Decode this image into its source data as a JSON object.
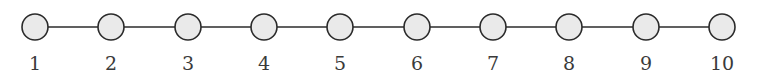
{
  "figure": {
    "background_color": "#ffffff",
    "layout": "horizontal-path"
  },
  "style": {
    "node_fill": "#eaeaea",
    "node_stroke": "#2b2b2b",
    "node_stroke_width": 1.6,
    "node_radius": 13,
    "edge_stroke": "#2b2b2b",
    "edge_stroke_width": 1.5,
    "label_color": "#3a3a3a",
    "label_font_size": 19,
    "label_baseline_y": 70,
    "node_center_y": 27
  },
  "chart_data": {
    "type": "diagram",
    "diagram_kind": "graph",
    "graph_family": "path",
    "title": "",
    "xlabel": "",
    "ylabel": "",
    "node_count": 10,
    "edge_count": 9,
    "nodes": [
      {
        "id": 1,
        "label": "1",
        "x": 35,
        "y": 27
      },
      {
        "id": 2,
        "label": "2",
        "x": 111,
        "y": 27
      },
      {
        "id": 3,
        "label": "3",
        "x": 188,
        "y": 27
      },
      {
        "id": 4,
        "label": "4",
        "x": 264,
        "y": 27
      },
      {
        "id": 5,
        "label": "5",
        "x": 340,
        "y": 27
      },
      {
        "id": 6,
        "label": "6",
        "x": 417,
        "y": 27
      },
      {
        "id": 7,
        "label": "7",
        "x": 493,
        "y": 27
      },
      {
        "id": 8,
        "label": "8",
        "x": 569,
        "y": 27
      },
      {
        "id": 9,
        "label": "9",
        "x": 646,
        "y": 27
      },
      {
        "id": 10,
        "label": "10",
        "x": 722,
        "y": 27
      }
    ],
    "edges": [
      {
        "source": 1,
        "target": 2
      },
      {
        "source": 2,
        "target": 3
      },
      {
        "source": 3,
        "target": 4
      },
      {
        "source": 4,
        "target": 5
      },
      {
        "source": 5,
        "target": 6
      },
      {
        "source": 6,
        "target": 7
      },
      {
        "source": 7,
        "target": 8
      },
      {
        "source": 8,
        "target": 9
      },
      {
        "source": 9,
        "target": 10
      }
    ],
    "labels": [
      "1",
      "2",
      "3",
      "4",
      "5",
      "6",
      "7",
      "8",
      "9",
      "10"
    ]
  }
}
